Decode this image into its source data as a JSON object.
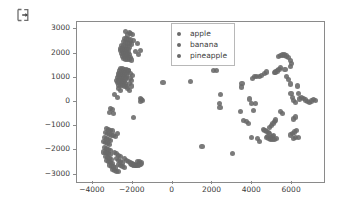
{
  "icon": {
    "name": "export-icon"
  },
  "chart_data": {
    "type": "scatter",
    "title": "",
    "xlabel": "",
    "ylabel": "",
    "xlim": [
      -4800,
      7600
    ],
    "ylim": [
      -3300,
      3300
    ],
    "grid": false,
    "legend_position": "upper center",
    "marker_color": "#696969",
    "frame_color": "#8a8a8a",
    "xticks": [
      -4000,
      -2000,
      0,
      2000,
      4000,
      6000
    ],
    "xtick_labels": [
      "−4000",
      "−2000",
      "0",
      "2000",
      "4000",
      "6000"
    ],
    "yticks": [
      3000,
      2000,
      1000,
      0,
      -1000,
      -2000,
      -3000
    ],
    "ytick_labels": [
      "3000",
      "2000",
      "1000",
      "0",
      "−1000",
      "−2000",
      "−3000"
    ],
    "series": [
      {
        "name": "apple",
        "color": "#696969",
        "points": [
          [
            -2350,
            2900
          ],
          [
            -2180,
            2870
          ],
          [
            -2120,
            2830
          ],
          [
            -2270,
            2760
          ],
          [
            -2000,
            2790
          ],
          [
            -2420,
            2620
          ],
          [
            -2300,
            2600
          ],
          [
            -2200,
            2580
          ],
          [
            -2100,
            2560
          ],
          [
            -1980,
            2540
          ],
          [
            -2480,
            2480
          ],
          [
            -2380,
            2450
          ],
          [
            -2280,
            2430
          ],
          [
            -2180,
            2410
          ],
          [
            -2080,
            2390
          ],
          [
            -2560,
            2340
          ],
          [
            -2460,
            2320
          ],
          [
            -2360,
            2300
          ],
          [
            -2260,
            2280
          ],
          [
            -2160,
            2260
          ],
          [
            -2600,
            2220
          ],
          [
            -2500,
            2200
          ],
          [
            -2400,
            2180
          ],
          [
            -2300,
            2170
          ],
          [
            -2200,
            2150
          ],
          [
            -2620,
            2120
          ],
          [
            -2520,
            2100
          ],
          [
            -2420,
            2090
          ],
          [
            -2320,
            2070
          ],
          [
            -2220,
            2050
          ],
          [
            -2580,
            2010
          ],
          [
            -2480,
            1990
          ],
          [
            -2380,
            1980
          ],
          [
            -2280,
            1960
          ],
          [
            -2170,
            1950
          ],
          [
            -2520,
            1900
          ],
          [
            -2420,
            1880
          ],
          [
            -2320,
            1870
          ],
          [
            -2230,
            1850
          ],
          [
            -2120,
            1840
          ],
          [
            -2450,
            1790
          ],
          [
            -2350,
            1770
          ],
          [
            -2250,
            1760
          ],
          [
            -2150,
            1740
          ],
          [
            -2050,
            1730
          ],
          [
            -1780,
            2410
          ],
          [
            -1880,
            2070
          ],
          [
            -1700,
            1960
          ],
          [
            -1600,
            2140
          ],
          [
            -2620,
            1380
          ],
          [
            -2520,
            1360
          ],
          [
            -2420,
            1340
          ],
          [
            -2320,
            1320
          ],
          [
            -2220,
            1300
          ],
          [
            -2660,
            1280
          ],
          [
            -2560,
            1260
          ],
          [
            -2460,
            1240
          ],
          [
            -2360,
            1230
          ],
          [
            -2260,
            1210
          ],
          [
            -2700,
            1180
          ],
          [
            -2600,
            1160
          ],
          [
            -2500,
            1150
          ],
          [
            -2400,
            1130
          ],
          [
            -2300,
            1110
          ],
          [
            -2720,
            1080
          ],
          [
            -2620,
            1070
          ],
          [
            -2520,
            1050
          ],
          [
            -2420,
            1030
          ],
          [
            -2320,
            1020
          ],
          [
            -2760,
            1000
          ],
          [
            -2660,
            980
          ],
          [
            -2560,
            960
          ],
          [
            -2460,
            950
          ],
          [
            -2360,
            930
          ],
          [
            -2800,
            900
          ],
          [
            -2700,
            880
          ],
          [
            -2600,
            870
          ],
          [
            -2500,
            850
          ],
          [
            -2400,
            840
          ],
          [
            -2760,
            800
          ],
          [
            -2660,
            790
          ],
          [
            -2560,
            770
          ],
          [
            -2460,
            760
          ],
          [
            -2360,
            740
          ],
          [
            -2700,
            700
          ],
          [
            -2600,
            690
          ],
          [
            -2500,
            670
          ],
          [
            -2400,
            660
          ],
          [
            -2300,
            640
          ],
          [
            -2200,
            1290
          ],
          [
            -2100,
            1180
          ],
          [
            -2000,
            1080
          ],
          [
            -2140,
            980
          ],
          [
            -2050,
            880
          ],
          [
            -2180,
            760
          ],
          [
            -2080,
            660
          ],
          [
            -2280,
            560
          ],
          [
            -2180,
            480
          ],
          [
            -2720,
            560
          ],
          [
            -2620,
            480
          ],
          [
            -2900,
            320
          ],
          [
            -2760,
            180
          ],
          [
            -1620,
            140
          ],
          [
            -1560,
            100
          ],
          [
            -1500,
            60
          ],
          [
            -1600,
            30
          ],
          [
            -3100,
            -260
          ],
          [
            -3000,
            -320
          ],
          [
            -3180,
            -420
          ],
          [
            -2980,
            -480
          ],
          [
            -1960,
            -640
          ],
          [
            -3320,
            -1080
          ],
          [
            -3220,
            -1120
          ],
          [
            -3120,
            -1160
          ],
          [
            -3020,
            -1200
          ],
          [
            -3380,
            -1260
          ],
          [
            -3280,
            -1300
          ],
          [
            -3180,
            -1340
          ],
          [
            -3080,
            -1380
          ],
          [
            -3420,
            -1460
          ],
          [
            -3320,
            -1500
          ],
          [
            -3220,
            -1540
          ],
          [
            -3120,
            -1580
          ],
          [
            -3460,
            -1640
          ],
          [
            -3360,
            -1680
          ],
          [
            -3260,
            -1720
          ],
          [
            -3160,
            -1760
          ],
          [
            -2980,
            -1380
          ],
          [
            -2880,
            -1440
          ],
          [
            -2780,
            -1300
          ],
          [
            -3400,
            -1880
          ],
          [
            -3300,
            -1920
          ],
          [
            -3200,
            -1960
          ],
          [
            -3100,
            -2000
          ],
          [
            -3440,
            -2060
          ],
          [
            -3340,
            -2100
          ],
          [
            -3240,
            -2140
          ],
          [
            -3140,
            -2180
          ],
          [
            -3380,
            -2240
          ],
          [
            -3280,
            -2280
          ],
          [
            -3180,
            -2320
          ],
          [
            -3080,
            -2360
          ],
          [
            -3300,
            -2420
          ],
          [
            -3200,
            -2460
          ],
          [
            -3100,
            -2500
          ],
          [
            -3000,
            -2540
          ],
          [
            -3180,
            -2600
          ],
          [
            -3080,
            -2640
          ],
          [
            -2980,
            -2680
          ],
          [
            -2880,
            -2720
          ],
          [
            -3020,
            -2780
          ],
          [
            -2920,
            -2820
          ],
          [
            -2820,
            -2860
          ],
          [
            -2720,
            -2880
          ],
          [
            -2900,
            -2080
          ],
          [
            -2800,
            -2140
          ],
          [
            -2700,
            -2200
          ],
          [
            -2600,
            -2260
          ],
          [
            -2820,
            -2340
          ],
          [
            -2720,
            -2400
          ],
          [
            -2620,
            -2460
          ],
          [
            -2520,
            -2520
          ],
          [
            -2700,
            -2580
          ],
          [
            -2600,
            -2620
          ],
          [
            -2500,
            -2660
          ],
          [
            -2400,
            -2700
          ],
          [
            -2420,
            -2340
          ],
          [
            -2320,
            -2400
          ],
          [
            -2220,
            -2460
          ],
          [
            -2120,
            -2520
          ],
          [
            -2040,
            -2560
          ],
          [
            -1940,
            -2600
          ],
          [
            -1840,
            -2620
          ],
          [
            -1740,
            -2600
          ],
          [
            -1640,
            -2560
          ],
          [
            -1560,
            -2520
          ],
          [
            -1660,
            -2460
          ],
          [
            -1760,
            -2440
          ]
        ]
      },
      {
        "name": "banana",
        "color": "#696969",
        "points": [
          [
            -480,
            820
          ],
          [
            900,
            860
          ],
          [
            1480,
            -1820
          ],
          [
            2060,
            1300
          ],
          [
            2220,
            1300
          ],
          [
            2420,
            320
          ],
          [
            2340,
            -60
          ],
          [
            2380,
            -240
          ],
          [
            3020,
            -2120
          ]
        ]
      },
      {
        "name": "pineapple",
        "color": "#696969",
        "points": [
          [
            3480,
            760
          ],
          [
            3460,
            620
          ],
          [
            3420,
            -380
          ],
          [
            3560,
            -760
          ],
          [
            3700,
            -820
          ],
          [
            3820,
            -880
          ],
          [
            3960,
            -1480
          ],
          [
            4080,
            -340
          ],
          [
            4180,
            -60
          ],
          [
            4220,
            1040
          ],
          [
            4360,
            1060
          ],
          [
            4480,
            1100
          ],
          [
            4600,
            1180
          ],
          [
            4700,
            1240
          ],
          [
            4560,
            -1140
          ],
          [
            4640,
            -1180
          ],
          [
            4720,
            -1220
          ],
          [
            4800,
            -1260
          ],
          [
            4880,
            -1300
          ],
          [
            4780,
            -1420
          ],
          [
            4700,
            -1460
          ],
          [
            4840,
            -1500
          ],
          [
            4920,
            -1460
          ],
          [
            5000,
            -1420
          ],
          [
            5080,
            -1380
          ],
          [
            4920,
            -1540
          ],
          [
            5020,
            -1560
          ],
          [
            5120,
            -1540
          ],
          [
            5220,
            -1500
          ],
          [
            4880,
            -1060
          ],
          [
            4960,
            -980
          ],
          [
            5040,
            -900
          ],
          [
            5100,
            -820
          ],
          [
            5160,
            -740
          ],
          [
            5100,
            1200
          ],
          [
            5180,
            1240
          ],
          [
            5260,
            1280
          ],
          [
            5340,
            1340
          ],
          [
            5420,
            1420
          ],
          [
            5320,
            1880
          ],
          [
            5420,
            1920
          ],
          [
            5520,
            1940
          ],
          [
            5620,
            1940
          ],
          [
            5720,
            1900
          ],
          [
            5820,
            1820
          ],
          [
            5900,
            1720
          ],
          [
            5960,
            1600
          ],
          [
            5920,
            1460
          ],
          [
            5640,
            1340
          ],
          [
            5720,
            1060
          ],
          [
            5820,
            940
          ],
          [
            5900,
            740
          ],
          [
            5940,
            340
          ],
          [
            6000,
            180
          ],
          [
            6080,
            60
          ],
          [
            6160,
            -20
          ],
          [
            6240,
            -1160
          ],
          [
            6120,
            -1240
          ],
          [
            6020,
            -1300
          ],
          [
            5920,
            -1360
          ],
          [
            6160,
            -1480
          ],
          [
            6060,
            -1520
          ],
          [
            6320,
            -1460
          ],
          [
            6380,
            120
          ],
          [
            6480,
            180
          ],
          [
            6580,
            140
          ],
          [
            6680,
            80
          ],
          [
            6780,
            20
          ],
          [
            6880,
            -20
          ],
          [
            6980,
            40
          ],
          [
            7080,
            100
          ],
          [
            7160,
            60
          ],
          [
            6260,
            660
          ],
          [
            6340,
            360
          ],
          [
            6180,
            -620
          ],
          [
            6080,
            -700
          ],
          [
            5420,
            -380
          ],
          [
            5520,
            -460
          ],
          [
            4380,
            -1620
          ],
          [
            4260,
            -1520
          ],
          [
            3960,
            -60
          ],
          [
            3880,
            120
          ],
          [
            4120,
            1040
          ],
          [
            4020,
            980
          ]
        ]
      }
    ]
  },
  "legend": {
    "entries": [
      {
        "label": "apple"
      },
      {
        "label": "banana"
      },
      {
        "label": "pineapple"
      }
    ]
  }
}
